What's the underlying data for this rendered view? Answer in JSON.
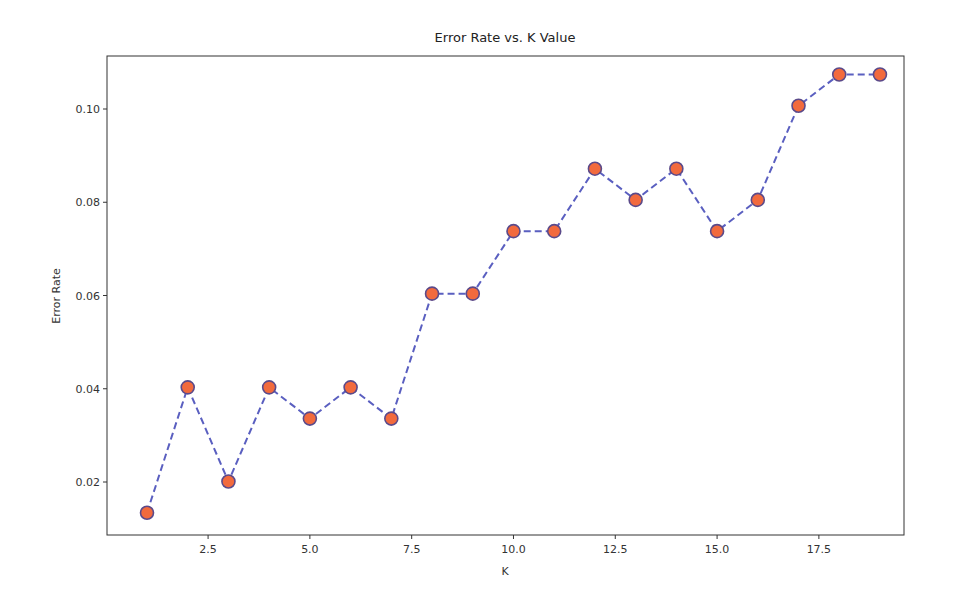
{
  "chart_data": {
    "type": "line",
    "title": "Error Rate vs. K Value",
    "xlabel": "K",
    "ylabel": "Error Rate",
    "x": [
      1,
      2,
      3,
      4,
      5,
      6,
      7,
      8,
      9,
      10,
      11,
      12,
      13,
      14,
      15,
      16,
      17,
      18,
      19
    ],
    "series": [
      {
        "name": "Error Rate",
        "values": [
          0.0134,
          0.0403,
          0.0201,
          0.0403,
          0.0336,
          0.0403,
          0.0336,
          0.0604,
          0.0604,
          0.0738,
          0.0738,
          0.0872,
          0.0805,
          0.0872,
          0.0738,
          0.0805,
          0.1007,
          0.1074,
          0.1074
        ],
        "line_color": "#5a5fc0",
        "line_style": "dashed",
        "marker": "circle",
        "marker_color": "#f26a3d",
        "marker_edge_color": "#5b4a8a"
      }
    ],
    "xticks": [
      2.5,
      5.0,
      7.5,
      10.0,
      12.5,
      15.0,
      17.5
    ],
    "xtick_labels": [
      "2.5",
      "5.0",
      "7.5",
      "10.0",
      "12.5",
      "15.0",
      "17.5"
    ],
    "yticks": [
      0.02,
      0.04,
      0.06,
      0.08,
      0.1
    ],
    "ytick_labels": [
      "0.02",
      "0.04",
      "0.06",
      "0.08",
      "0.10"
    ],
    "xlim": [
      0.1,
      19.9
    ],
    "ylim": [
      0.0089,
      0.1119
    ],
    "grid": false,
    "legend": null
  }
}
